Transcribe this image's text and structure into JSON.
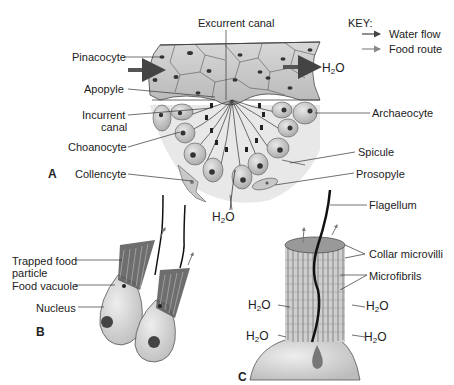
{
  "figure": {
    "panels": [
      "A",
      "B",
      "C"
    ],
    "key": {
      "title": "KEY:",
      "items": [
        {
          "label": "Water flow",
          "color": "#444444"
        },
        {
          "label": "Food route",
          "color": "#888888"
        }
      ]
    },
    "panel_a": {
      "labels": {
        "excurrent_canal": "Excurrent canal",
        "pinacocyte": "Pinacocyte",
        "apopyle": "Apopyle",
        "incurrent_canal_1": "Incurrent",
        "incurrent_canal_2": "canal",
        "choanocyte": "Choanocyte",
        "collencyte": "Collencyte",
        "archaeocyte": "Archaeocyte",
        "spicule": "Spicule",
        "prosopyle": "Prosopyle",
        "water_out_h": "H",
        "water_out_2": "2",
        "water_out_o": "O",
        "water_in_h": "H",
        "water_in_2": "2",
        "water_in_o": "O"
      }
    },
    "panel_b": {
      "labels": {
        "trapped_food_1": "Trapped food",
        "trapped_food_2": "particle",
        "food_vacuole": "Food vacuole",
        "nucleus": "Nucleus"
      }
    },
    "panel_c": {
      "labels": {
        "flagellum": "Flagellum",
        "collar_microvilli": "Collar microvilli",
        "microfibrils": "Microfibrils",
        "h2o": "H",
        "sub2": "2",
        "o": "O"
      }
    },
    "colors": {
      "tissue": "#cfcfcf",
      "tissue_dark": "#a9a9a9",
      "cell_fill": "#bdbdbd",
      "nucleus": "#3a3a3a",
      "line": "#333333",
      "background_shade": "#e6e6e6"
    }
  }
}
